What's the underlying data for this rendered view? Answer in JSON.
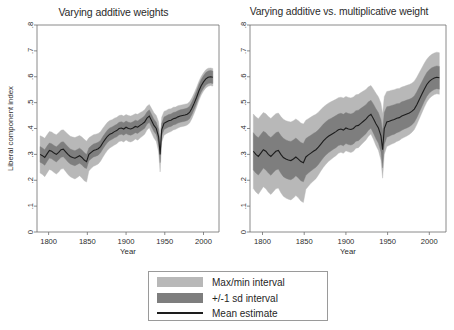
{
  "figure": {
    "background": "#ffffff",
    "panels": [
      {
        "id": "left",
        "title": "Varying additive weights"
      },
      {
        "id": "right",
        "title": "Varying additive vs. multiplicative weight"
      }
    ]
  },
  "legend": {
    "items": [
      {
        "label": "Max/min interval",
        "marker": "swatch",
        "color": "#b8b8b8"
      },
      {
        "label": "+/-1 sd interval",
        "marker": "swatch",
        "color": "#7e7e7e"
      },
      {
        "label": "Mean estimate",
        "marker": "line",
        "color": "#1d1d1d"
      }
    ]
  },
  "colors": {
    "maxmin_band": "#b8b8b8",
    "sd_band": "#7e7e7e",
    "mean_line": "#1d1d1d",
    "axis": "#6d6d6d",
    "text": "#2b2b2b",
    "legend_border": "#9a9a9a"
  },
  "chart_data": [
    {
      "type": "line",
      "id": "varying-additive-weights",
      "title": "Varying additive weights",
      "xlabel": "Year",
      "ylabel": "Liberal component index",
      "xlim": [
        1785,
        2020
      ],
      "ylim": [
        0,
        0.8
      ],
      "xticks": [
        1800,
        1850,
        1900,
        1950,
        2000
      ],
      "xtick_labels": [
        "1800",
        "1850",
        "1900",
        "1950",
        "2000"
      ],
      "yticks": [
        0,
        0.1,
        0.2,
        0.3,
        0.4,
        0.5,
        0.6,
        0.7,
        0.8
      ],
      "ytick_labels": [
        "0",
        ".1",
        ".2",
        ".3",
        ".4",
        ".5",
        ".6",
        ".7",
        ".8"
      ],
      "grid": false,
      "legend_position": "below-figure",
      "x": [
        1789,
        1792,
        1795,
        1798,
        1801,
        1804,
        1807,
        1810,
        1813,
        1816,
        1819,
        1822,
        1825,
        1828,
        1831,
        1834,
        1837,
        1840,
        1843,
        1846,
        1849,
        1852,
        1855,
        1858,
        1861,
        1864,
        1867,
        1870,
        1873,
        1876,
        1879,
        1882,
        1885,
        1888,
        1891,
        1894,
        1897,
        1900,
        1903,
        1906,
        1909,
        1912,
        1915,
        1918,
        1921,
        1924,
        1927,
        1930,
        1933,
        1936,
        1939,
        1942,
        1944,
        1946,
        1949,
        1952,
        1955,
        1958,
        1961,
        1964,
        1967,
        1970,
        1973,
        1976,
        1979,
        1982,
        1985,
        1988,
        1991,
        1994,
        1997,
        2000,
        2003,
        2006,
        2009,
        2012
      ],
      "series": [
        {
          "name": "Mean estimate",
          "values": [
            0.3,
            0.295,
            0.288,
            0.302,
            0.315,
            0.312,
            0.305,
            0.3,
            0.308,
            0.318,
            0.32,
            0.31,
            0.3,
            0.292,
            0.288,
            0.285,
            0.29,
            0.295,
            0.288,
            0.278,
            0.272,
            0.3,
            0.308,
            0.315,
            0.318,
            0.322,
            0.33,
            0.345,
            0.358,
            0.37,
            0.378,
            0.382,
            0.388,
            0.392,
            0.4,
            0.402,
            0.398,
            0.405,
            0.4,
            0.398,
            0.402,
            0.408,
            0.405,
            0.412,
            0.418,
            0.425,
            0.44,
            0.448,
            0.43,
            0.412,
            0.4,
            0.368,
            0.3,
            0.395,
            0.42,
            0.425,
            0.43,
            0.432,
            0.438,
            0.44,
            0.445,
            0.448,
            0.45,
            0.452,
            0.455,
            0.462,
            0.478,
            0.498,
            0.52,
            0.545,
            0.565,
            0.58,
            0.592,
            0.598,
            0.6,
            0.598
          ]
        },
        {
          "name": "+/-1 sd lower",
          "values": [
            0.27,
            0.265,
            0.258,
            0.272,
            0.286,
            0.283,
            0.276,
            0.271,
            0.279,
            0.289,
            0.291,
            0.281,
            0.271,
            0.263,
            0.259,
            0.256,
            0.261,
            0.266,
            0.259,
            0.249,
            0.245,
            0.275,
            0.283,
            0.29,
            0.293,
            0.297,
            0.306,
            0.321,
            0.334,
            0.346,
            0.354,
            0.358,
            0.364,
            0.368,
            0.376,
            0.378,
            0.374,
            0.381,
            0.376,
            0.374,
            0.378,
            0.384,
            0.381,
            0.388,
            0.394,
            0.401,
            0.416,
            0.424,
            0.406,
            0.388,
            0.376,
            0.34,
            0.268,
            0.371,
            0.396,
            0.401,
            0.406,
            0.408,
            0.414,
            0.416,
            0.421,
            0.424,
            0.426,
            0.428,
            0.431,
            0.438,
            0.454,
            0.474,
            0.496,
            0.521,
            0.541,
            0.556,
            0.568,
            0.574,
            0.576,
            0.574
          ]
        },
        {
          "name": "+/-1 sd upper",
          "values": [
            0.33,
            0.325,
            0.318,
            0.332,
            0.344,
            0.341,
            0.334,
            0.329,
            0.337,
            0.347,
            0.349,
            0.339,
            0.329,
            0.321,
            0.317,
            0.314,
            0.319,
            0.324,
            0.317,
            0.307,
            0.3,
            0.325,
            0.333,
            0.34,
            0.343,
            0.347,
            0.354,
            0.369,
            0.382,
            0.394,
            0.402,
            0.406,
            0.412,
            0.416,
            0.424,
            0.426,
            0.422,
            0.429,
            0.424,
            0.422,
            0.426,
            0.432,
            0.429,
            0.436,
            0.442,
            0.449,
            0.464,
            0.472,
            0.454,
            0.436,
            0.424,
            0.396,
            0.332,
            0.419,
            0.444,
            0.449,
            0.454,
            0.456,
            0.462,
            0.464,
            0.469,
            0.472,
            0.474,
            0.476,
            0.479,
            0.486,
            0.502,
            0.522,
            0.544,
            0.569,
            0.589,
            0.604,
            0.616,
            0.622,
            0.624,
            0.622
          ]
        },
        {
          "name": "Max/min lower",
          "values": [
            0.228,
            0.222,
            0.214,
            0.228,
            0.242,
            0.238,
            0.23,
            0.224,
            0.232,
            0.243,
            0.245,
            0.234,
            0.222,
            0.214,
            0.209,
            0.205,
            0.211,
            0.217,
            0.209,
            0.198,
            0.193,
            0.236,
            0.246,
            0.254,
            0.258,
            0.263,
            0.273,
            0.289,
            0.303,
            0.316,
            0.325,
            0.33,
            0.336,
            0.341,
            0.35,
            0.352,
            0.348,
            0.356,
            0.35,
            0.348,
            0.352,
            0.359,
            0.355,
            0.363,
            0.37,
            0.378,
            0.394,
            0.403,
            0.383,
            0.363,
            0.35,
            0.31,
            0.232,
            0.347,
            0.374,
            0.38,
            0.385,
            0.388,
            0.394,
            0.397,
            0.402,
            0.406,
            0.408,
            0.41,
            0.414,
            0.421,
            0.438,
            0.459,
            0.482,
            0.508,
            0.529,
            0.545,
            0.557,
            0.563,
            0.566,
            0.564
          ]
        },
        {
          "name": "Max/min upper",
          "values": [
            0.372,
            0.368,
            0.362,
            0.376,
            0.388,
            0.386,
            0.38,
            0.376,
            0.384,
            0.393,
            0.395,
            0.386,
            0.378,
            0.37,
            0.367,
            0.365,
            0.369,
            0.373,
            0.367,
            0.358,
            0.351,
            0.364,
            0.37,
            0.376,
            0.378,
            0.381,
            0.387,
            0.401,
            0.413,
            0.424,
            0.431,
            0.434,
            0.44,
            0.443,
            0.45,
            0.452,
            0.448,
            0.454,
            0.45,
            0.448,
            0.452,
            0.457,
            0.455,
            0.461,
            0.466,
            0.472,
            0.486,
            0.493,
            0.477,
            0.461,
            0.45,
            0.426,
            0.368,
            0.443,
            0.466,
            0.47,
            0.475,
            0.476,
            0.482,
            0.483,
            0.488,
            0.49,
            0.492,
            0.494,
            0.496,
            0.503,
            0.518,
            0.537,
            0.558,
            0.582,
            0.601,
            0.615,
            0.627,
            0.633,
            0.634,
            0.632
          ]
        }
      ]
    },
    {
      "type": "line",
      "id": "varying-additive-vs-multiplicative-weight",
      "title": "Varying additive vs. multiplicative weight",
      "xlabel": "Year",
      "ylabel": "",
      "xlim": [
        1785,
        2020
      ],
      "ylim": [
        0,
        0.8
      ],
      "xticks": [
        1800,
        1850,
        1900,
        1950,
        2000
      ],
      "xtick_labels": [
        "1800",
        "1850",
        "1900",
        "1950",
        "2000"
      ],
      "yticks": [
        0,
        0.1,
        0.2,
        0.3,
        0.4,
        0.5,
        0.6,
        0.7,
        0.8
      ],
      "ytick_labels": [
        "0",
        ".1",
        ".2",
        ".3",
        ".4",
        ".5",
        ".6",
        ".7",
        ".8"
      ],
      "grid": false,
      "legend_position": "below-figure",
      "x": [
        1789,
        1792,
        1795,
        1798,
        1801,
        1804,
        1807,
        1810,
        1813,
        1816,
        1819,
        1822,
        1825,
        1828,
        1831,
        1834,
        1837,
        1840,
        1843,
        1846,
        1849,
        1852,
        1855,
        1858,
        1861,
        1864,
        1867,
        1870,
        1873,
        1876,
        1879,
        1882,
        1885,
        1888,
        1891,
        1894,
        1897,
        1900,
        1903,
        1906,
        1909,
        1912,
        1915,
        1918,
        1921,
        1924,
        1927,
        1930,
        1933,
        1936,
        1939,
        1942,
        1944,
        1946,
        1949,
        1952,
        1955,
        1958,
        1961,
        1964,
        1967,
        1970,
        1973,
        1976,
        1979,
        1982,
        1985,
        1988,
        1991,
        1994,
        1997,
        2000,
        2003,
        2006,
        2009,
        2012
      ],
      "series": [
        {
          "name": "Mean estimate",
          "values": [
            0.312,
            0.3,
            0.292,
            0.305,
            0.318,
            0.312,
            0.3,
            0.292,
            0.302,
            0.312,
            0.315,
            0.3,
            0.288,
            0.282,
            0.278,
            0.276,
            0.282,
            0.29,
            0.282,
            0.272,
            0.268,
            0.29,
            0.298,
            0.305,
            0.312,
            0.318,
            0.328,
            0.34,
            0.352,
            0.362,
            0.37,
            0.376,
            0.382,
            0.388,
            0.395,
            0.398,
            0.394,
            0.402,
            0.398,
            0.396,
            0.4,
            0.41,
            0.412,
            0.42,
            0.428,
            0.436,
            0.448,
            0.455,
            0.438,
            0.418,
            0.402,
            0.372,
            0.318,
            0.4,
            0.425,
            0.428,
            0.432,
            0.435,
            0.44,
            0.442,
            0.448,
            0.452,
            0.456,
            0.46,
            0.466,
            0.475,
            0.492,
            0.512,
            0.532,
            0.552,
            0.57,
            0.582,
            0.59,
            0.595,
            0.598,
            0.596
          ]
        },
        {
          "name": "+/-1 sd lower",
          "values": [
            0.24,
            0.228,
            0.22,
            0.233,
            0.247,
            0.24,
            0.228,
            0.219,
            0.23,
            0.24,
            0.243,
            0.227,
            0.214,
            0.208,
            0.204,
            0.202,
            0.208,
            0.217,
            0.209,
            0.198,
            0.194,
            0.219,
            0.228,
            0.236,
            0.243,
            0.25,
            0.261,
            0.274,
            0.287,
            0.298,
            0.306,
            0.313,
            0.32,
            0.326,
            0.334,
            0.337,
            0.333,
            0.342,
            0.338,
            0.336,
            0.34,
            0.351,
            0.353,
            0.362,
            0.371,
            0.38,
            0.393,
            0.401,
            0.382,
            0.36,
            0.343,
            0.31,
            0.248,
            0.338,
            0.366,
            0.37,
            0.375,
            0.378,
            0.384,
            0.387,
            0.393,
            0.398,
            0.402,
            0.407,
            0.414,
            0.424,
            0.442,
            0.463,
            0.484,
            0.505,
            0.524,
            0.537,
            0.545,
            0.551,
            0.554,
            0.552
          ]
        },
        {
          "name": "+/-1 sd upper",
          "values": [
            0.384,
            0.372,
            0.364,
            0.377,
            0.389,
            0.384,
            0.372,
            0.365,
            0.374,
            0.384,
            0.387,
            0.373,
            0.362,
            0.356,
            0.352,
            0.35,
            0.356,
            0.363,
            0.355,
            0.346,
            0.342,
            0.361,
            0.368,
            0.374,
            0.381,
            0.386,
            0.395,
            0.406,
            0.417,
            0.426,
            0.434,
            0.439,
            0.444,
            0.45,
            0.456,
            0.459,
            0.455,
            0.462,
            0.458,
            0.456,
            0.46,
            0.469,
            0.471,
            0.478,
            0.485,
            0.492,
            0.503,
            0.509,
            0.494,
            0.476,
            0.461,
            0.434,
            0.388,
            0.462,
            0.484,
            0.486,
            0.489,
            0.492,
            0.496,
            0.497,
            0.503,
            0.506,
            0.51,
            0.513,
            0.518,
            0.526,
            0.542,
            0.561,
            0.58,
            0.599,
            0.616,
            0.627,
            0.635,
            0.639,
            0.642,
            0.64
          ]
        },
        {
          "name": "Max/min lower",
          "values": [
            0.168,
            0.155,
            0.146,
            0.16,
            0.175,
            0.167,
            0.154,
            0.145,
            0.156,
            0.167,
            0.17,
            0.152,
            0.138,
            0.131,
            0.127,
            0.124,
            0.131,
            0.141,
            0.132,
            0.12,
            0.114,
            0.165,
            0.177,
            0.188,
            0.197,
            0.206,
            0.22,
            0.236,
            0.25,
            0.262,
            0.272,
            0.28,
            0.288,
            0.295,
            0.304,
            0.308,
            0.304,
            0.314,
            0.31,
            0.307,
            0.312,
            0.324,
            0.326,
            0.336,
            0.346,
            0.356,
            0.37,
            0.379,
            0.358,
            0.334,
            0.315,
            0.278,
            0.208,
            0.3,
            0.33,
            0.335,
            0.34,
            0.344,
            0.35,
            0.354,
            0.361,
            0.366,
            0.371,
            0.377,
            0.385,
            0.396,
            0.415,
            0.438,
            0.46,
            0.482,
            0.502,
            0.516,
            0.525,
            0.531,
            0.534,
            0.532
          ]
        },
        {
          "name": "Max/min upper",
          "values": [
            0.456,
            0.445,
            0.438,
            0.45,
            0.462,
            0.457,
            0.446,
            0.439,
            0.448,
            0.457,
            0.46,
            0.446,
            0.436,
            0.43,
            0.427,
            0.425,
            0.43,
            0.437,
            0.43,
            0.421,
            0.417,
            0.432,
            0.438,
            0.444,
            0.45,
            0.455,
            0.463,
            0.473,
            0.483,
            0.491,
            0.498,
            0.503,
            0.508,
            0.513,
            0.519,
            0.521,
            0.518,
            0.524,
            0.52,
            0.518,
            0.522,
            0.53,
            0.532,
            0.539,
            0.545,
            0.551,
            0.561,
            0.566,
            0.552,
            0.536,
            0.522,
            0.498,
            0.456,
            0.523,
            0.543,
            0.545,
            0.548,
            0.55,
            0.554,
            0.555,
            0.56,
            0.563,
            0.567,
            0.57,
            0.575,
            0.583,
            0.598,
            0.616,
            0.634,
            0.652,
            0.668,
            0.679,
            0.687,
            0.692,
            0.695,
            0.693
          ]
        }
      ]
    }
  ]
}
